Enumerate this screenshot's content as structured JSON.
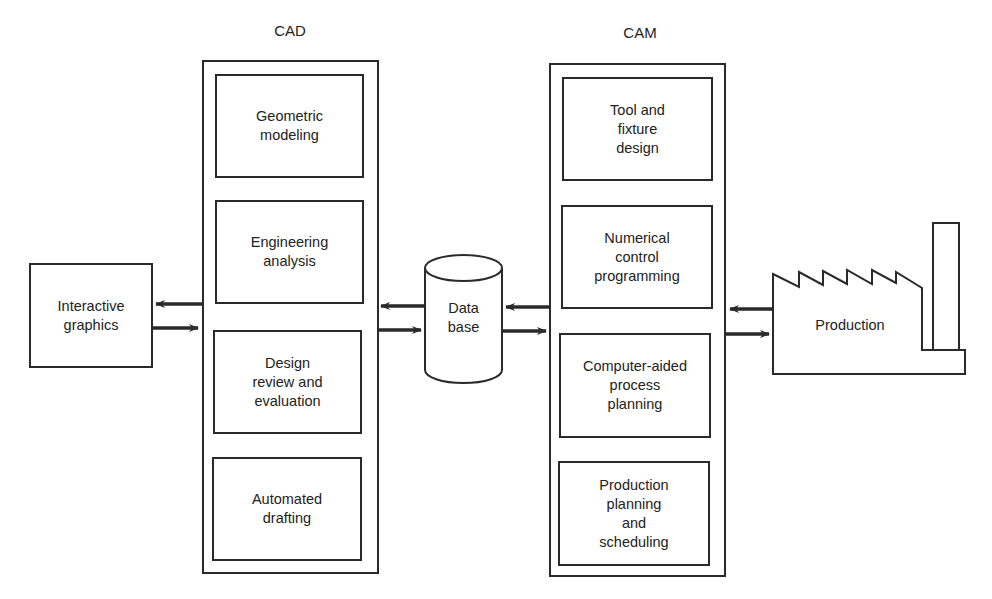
{
  "cad": {
    "title": "CAD",
    "items": [
      {
        "label": "Geometric\nmodeling"
      },
      {
        "label": "Engineering\nanalysis"
      },
      {
        "label": "Design\nreview and\nevaluation"
      },
      {
        "label": "Automated\ndrafting"
      }
    ]
  },
  "cam": {
    "title": "CAM",
    "items": [
      {
        "label": "Tool and\nfixture\ndesign"
      },
      {
        "label": "Numerical\ncontrol\nprogramming"
      },
      {
        "label": "Computer-aided\nprocess\nplanning"
      },
      {
        "label": "Production\nplanning\nand\nscheduling"
      }
    ]
  },
  "interactive_graphics": {
    "label": "Interactive\ngraphics"
  },
  "database": {
    "label": "Data\nbase"
  },
  "production": {
    "label": "Production"
  },
  "colors": {
    "line": "#2a2a2a",
    "background": "#ffffff",
    "text": "#222222"
  }
}
